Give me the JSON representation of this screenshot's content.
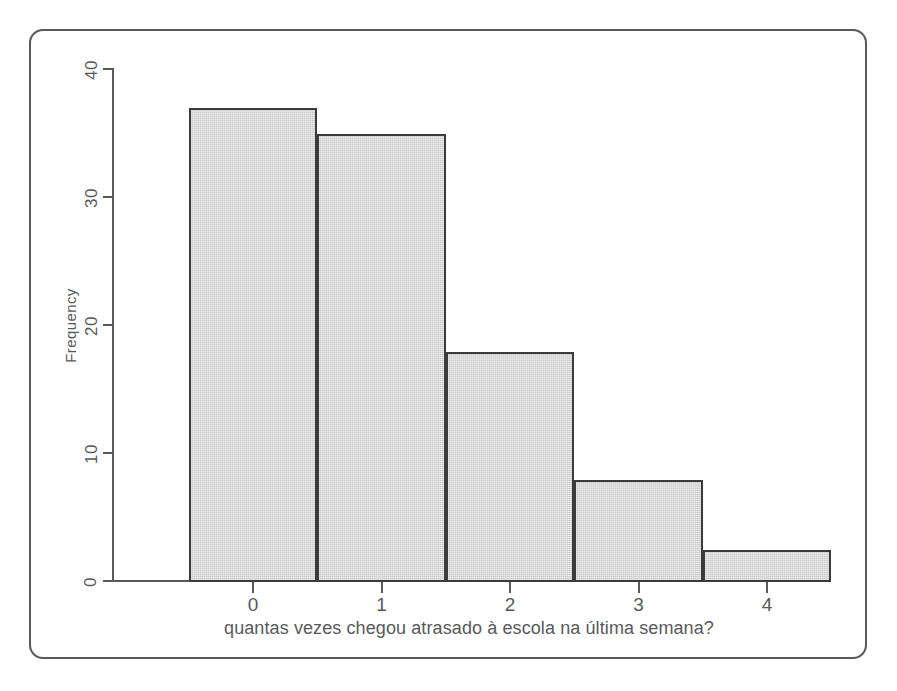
{
  "figure": {
    "border_color": "#58595b",
    "axis_color": "#58595b",
    "bar_fill": "#cfcfcf",
    "bar_edge": "#3b3b3b"
  },
  "chart_data": {
    "type": "bar",
    "chart_subtype": "histogram",
    "title": "",
    "subtitle": "",
    "xlabel": "quantas vezes chegou atrasado à escola na última semana?",
    "ylabel": "Frequency",
    "categories": [
      "0",
      "1",
      "2",
      "3",
      "4"
    ],
    "values": [
      37,
      35,
      18,
      8,
      2.5
    ],
    "bin_edges": [
      -0.5,
      0.5,
      1.5,
      2.5,
      3.5,
      4.5
    ],
    "xtick_labels": [
      "0",
      "1",
      "2",
      "3",
      "4"
    ],
    "xtick_values": [
      0,
      1,
      2,
      3,
      4
    ],
    "ytick_labels": [
      "0",
      "10",
      "20",
      "30",
      "40"
    ],
    "ytick_values": [
      0,
      10,
      20,
      30,
      40
    ],
    "xlim": [
      -0.85,
      4.95
    ],
    "ylim": [
      0,
      42
    ],
    "grid": false,
    "legend": null,
    "legend_position": "none",
    "annotations": []
  }
}
